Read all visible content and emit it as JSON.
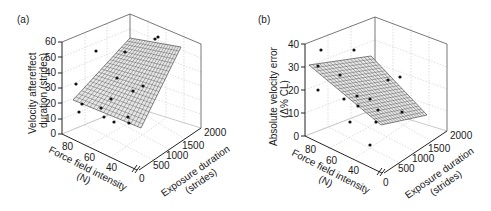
{
  "chart_data": [
    {
      "panel": "(a)",
      "type": "scatter3d_with_plane",
      "title": "",
      "zlabel": "Velocity aftereffect duration (strides)",
      "zlabel_lines": [
        "Velocity aftereffect",
        "duration (strides)"
      ],
      "xlabel": "Force field intensity (N)",
      "xlabel_lines": [
        "Force field intensity",
        "(N)"
      ],
      "ylabel": "Exposure duration (strides)",
      "ylabel_lines": [
        "Exposure duration",
        "(strides)"
      ],
      "z_ticks": [
        "0",
        "10",
        "20",
        "30",
        "40",
        "50",
        "60"
      ],
      "x_ticks": [
        "80",
        "60",
        "40"
      ],
      "y_ticks": [
        "0",
        "500",
        "1000",
        "1500",
        "2000"
      ],
      "zlim": [
        0,
        60
      ],
      "xlim": [
        30,
        85
      ],
      "ylim": [
        0,
        2000
      ],
      "axis_break": "//",
      "grid": true,
      "fitted_plane": {
        "description": "regression plane increasing with exposure duration and force",
        "z_at_corners": {
          "f80_e0": 22,
          "f30_e0": 10,
          "f80_e2000": 55,
          "f30_e2000": 40
        }
      },
      "points_screen": [
        [
          96,
          51
        ],
        [
          76,
          84
        ],
        [
          82,
          104
        ],
        [
          79,
          112
        ],
        [
          101,
          108
        ],
        [
          111,
          99
        ],
        [
          117,
          78
        ],
        [
          104,
          117
        ],
        [
          114,
          122
        ],
        [
          128,
          117
        ],
        [
          129,
          123
        ],
        [
          133,
          91
        ],
        [
          143,
          86
        ],
        [
          125,
          52
        ],
        [
          155,
          39
        ],
        [
          158,
          37
        ]
      ]
    },
    {
      "panel": "(b)",
      "type": "scatter3d_with_plane",
      "title": "",
      "zlabel": "Absolute velocity error (Δ% CL)",
      "zlabel_lines": [
        "Absolute velocity error",
        "(Δ% CL)"
      ],
      "xlabel": "Force field intensity (N)",
      "xlabel_lines": [
        "Force field intensity",
        "(N)"
      ],
      "ylabel": "Exposure duration (strides)",
      "ylabel_lines": [
        "Exposure duration",
        "(strides)"
      ],
      "z_ticks": [
        "0",
        "10",
        "20",
        "30",
        "40"
      ],
      "x_ticks": [
        "80",
        "60",
        "40"
      ],
      "y_ticks": [
        "0",
        "500",
        "1000",
        "1500",
        "2000"
      ],
      "zlim": [
        0,
        40
      ],
      "xlim": [
        30,
        85
      ],
      "ylim": [
        0,
        2000
      ],
      "axis_break": "//",
      "grid": true,
      "fitted_plane": {
        "description": "regression plane decreasing with exposure duration",
        "z_at_corners": {
          "f80_e0": 31,
          "f30_e0": 8,
          "f80_e2000": 22,
          "f30_e2000": 12
        }
      },
      "points_screen": [
        [
          321,
          50
        ],
        [
          354,
          50
        ],
        [
          318,
          66
        ],
        [
          318,
          90
        ],
        [
          340,
          75
        ],
        [
          344,
          99
        ],
        [
          357,
          96
        ],
        [
          358,
          106
        ],
        [
          370,
          99
        ],
        [
          378,
          110
        ],
        [
          376,
          122
        ],
        [
          350,
          122
        ],
        [
          370,
          145
        ],
        [
          388,
          80
        ],
        [
          400,
          77
        ],
        [
          402,
          112
        ]
      ]
    }
  ],
  "panels": {
    "a": {
      "label": "(a)"
    },
    "b": {
      "label": "(b)"
    }
  }
}
